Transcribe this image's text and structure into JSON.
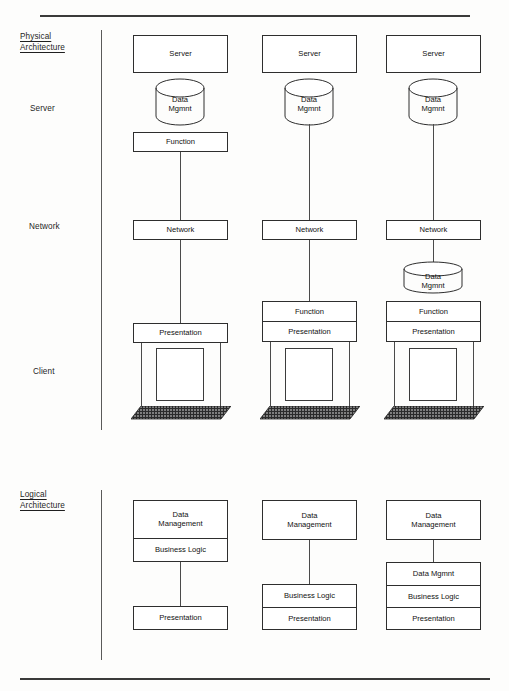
{
  "sections": [
    {
      "id": "physical",
      "label": "Physical\nArchitecture",
      "row_labels": [
        {
          "id": "server",
          "label": "Server"
        },
        {
          "id": "network",
          "label": "Network"
        },
        {
          "id": "client",
          "label": "Client"
        }
      ]
    },
    {
      "id": "logical",
      "label": "Logical\nArchitecture"
    }
  ],
  "physical": {
    "columns": [
      {
        "id": "column-1",
        "nodes": {
          "server": "Server",
          "server_data": "Data\nMgmnt",
          "server_function": "Function",
          "network": "Network",
          "client_stack": [
            "Presentation"
          ]
        }
      },
      {
        "id": "column-2",
        "nodes": {
          "server": "Server",
          "server_data": "Data\nMgmnt",
          "network": "Network",
          "client_stack": [
            "Function",
            "Presentation"
          ]
        }
      },
      {
        "id": "column-3",
        "nodes": {
          "server": "Server",
          "server_data": "Data\nMgmnt",
          "network": "Network",
          "client_data": "Data\nMgmnt",
          "client_stack": [
            "Function",
            "Presentation"
          ]
        }
      }
    ]
  },
  "logical": {
    "columns": [
      {
        "id": "logical-column-1",
        "top_stack": [
          "Data\nManagement",
          "Business Logic"
        ],
        "bottom_stack": [
          "Presentation"
        ]
      },
      {
        "id": "logical-column-2",
        "top_stack": [
          "Data\nManagement"
        ],
        "bottom_stack": [
          "Business Logic",
          "Presentation"
        ]
      },
      {
        "id": "logical-column-3",
        "top_stack": [
          "Data\nManagement"
        ],
        "bottom_stack": [
          "Data Mgmnt",
          "Business Logic",
          "Presentation"
        ]
      }
    ]
  },
  "colors": {
    "ink": "#2e2e2e",
    "rule": "#3a3a3a",
    "paper": "#fdfdfc",
    "keyboard": "#2b2b2b"
  }
}
